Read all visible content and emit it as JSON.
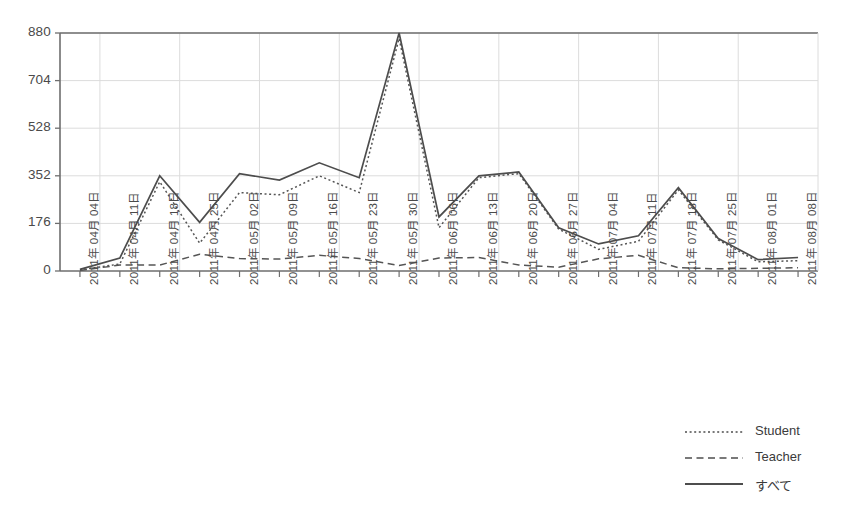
{
  "chart_data": {
    "type": "line",
    "title": "",
    "subtitle": "",
    "xlabel": "",
    "ylabel": "",
    "ylim": [
      0,
      880
    ],
    "yticks": [
      0,
      176,
      352,
      528,
      704,
      880
    ],
    "ytick_labels": [
      "0",
      "176",
      "352",
      "528",
      "704",
      "880"
    ],
    "grid": true,
    "legend_position": "bottom-right",
    "categories": [
      "2011年 04月 04日",
      "2011年 04月 11日",
      "2011年 04月 18日",
      "2011年 04月 25日",
      "2011年 05月 02日",
      "2011年 05月 09日",
      "2011年 05月 16日",
      "2011年 05月 23日",
      "2011年 05月 30日",
      "2011年 06月 06日",
      "2011年 06月 13日",
      "2011年 06月 20日",
      "2011年 06月 27日",
      "2011年 07月 04日",
      "2011年 07月 11日",
      "2011年 07月 18日",
      "2011年 07月 25日",
      "2011年 08月 01日",
      "2011年 08月 08日"
    ],
    "series": [
      {
        "name": "Student",
        "style": "dotted",
        "color": "#555555",
        "values": [
          4,
          26,
          330,
          103,
          290,
          282,
          352,
          290,
          860,
          160,
          345,
          360,
          155,
          80,
          110,
          300,
          115,
          34,
          38
        ]
      },
      {
        "name": "Teacher",
        "style": "dashed",
        "color": "#555555",
        "values": [
          2,
          22,
          22,
          62,
          46,
          44,
          58,
          46,
          20,
          48,
          50,
          22,
          14,
          45,
          58,
          12,
          8,
          10,
          12
        ]
      },
      {
        "name": "すべて",
        "style": "solid",
        "color": "#4d4d4d",
        "values": [
          6,
          48,
          352,
          180,
          360,
          336,
          400,
          345,
          880,
          200,
          352,
          366,
          160,
          100,
          130,
          308,
          120,
          42,
          50
        ]
      }
    ]
  },
  "legend": {
    "items": [
      {
        "label": "Student",
        "style": "dotted"
      },
      {
        "label": "Teacher",
        "style": "dashed"
      },
      {
        "label": "すべて",
        "style": "solid"
      }
    ]
  },
  "colors": {
    "axis": "#6e6e6e",
    "grid": "#dcdcdc",
    "text": "#4a4a4a",
    "line": "#4d4d4d",
    "background": "#ffffff"
  }
}
